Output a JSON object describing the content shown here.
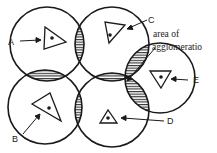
{
  "diagram": {
    "type": "overlapping market areas",
    "circles": [
      {
        "id": "A",
        "label": "A",
        "cx": 47,
        "cy": 44,
        "r": 37
      },
      {
        "id": "C",
        "label": "C",
        "cx": 112,
        "cy": 44,
        "r": 37
      },
      {
        "id": "B",
        "label": "B",
        "cx": 45,
        "cy": 107,
        "r": 37
      },
      {
        "id": "D",
        "label": "D",
        "cx": 112,
        "cy": 110,
        "r": 37
      },
      {
        "id": "E",
        "label": "E",
        "cx": 160,
        "cy": 78,
        "r": 35
      }
    ],
    "annotation": {
      "line1": "area of",
      "line2": "agglomeratio"
    },
    "colors": {
      "stroke": "#1a1a1a",
      "hatch": "#1a1a1a",
      "solid": "#111111",
      "background": "#ffffff"
    }
  }
}
